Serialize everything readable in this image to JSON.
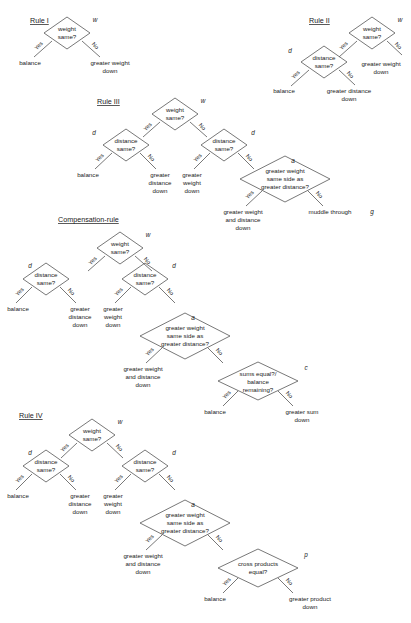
{
  "figure": {
    "type": "decision-tree-diagram",
    "background_color": "#ffffff",
    "line_color": "#555555",
    "text_color": "#1a1a1a"
  },
  "labels": {
    "weight_same": "weight",
    "weight_same2": "same?",
    "distance_same": "distance",
    "distance_same2": "same?",
    "yes": "Yes",
    "no": "No",
    "balance": "balance",
    "greater_weight": "greater weight",
    "down": "down",
    "greater": "greater",
    "distance": "distance",
    "weight": "weight",
    "muddle_through": "muddle through",
    "and_distance": "and distance",
    "same_side_as": "same side as",
    "greater_distance_q": "greater distance?",
    "greater_distance": "greater distance",
    "sums_equal": "sums equal?/",
    "balance_word": "balance",
    "remaining": "remaining?",
    "greater_sum": "greater sum",
    "cross_products": "cross products",
    "equal_q": "equal?",
    "greater_product": "greater product"
  },
  "cues": {
    "w": "w",
    "d": "d",
    "a": "a",
    "g": "g",
    "c": "c",
    "p": "p"
  },
  "sections": [
    {
      "id": "rule-1",
      "title": "Rule I",
      "nodes": [
        {
          "id": "r1-w",
          "cue": "w",
          "lines": [
            "weight",
            "same?"
          ]
        }
      ],
      "leaves": [
        {
          "id": "r1-balance",
          "lines": [
            "balance"
          ]
        },
        {
          "id": "r1-greater-weight",
          "lines": [
            "greater weight",
            "down"
          ]
        }
      ]
    },
    {
      "id": "rule-2",
      "title": "Rule II",
      "nodes": [
        {
          "id": "r2-w",
          "cue": "w",
          "lines": [
            "weight",
            "same?"
          ]
        },
        {
          "id": "r2-d",
          "cue": "d",
          "lines": [
            "distance",
            "same?"
          ]
        }
      ],
      "leaves": [
        {
          "id": "r2-greater-weight",
          "lines": [
            "greater weight",
            "down"
          ]
        },
        {
          "id": "r2-balance",
          "lines": [
            "balance"
          ]
        },
        {
          "id": "r2-greater-distance",
          "lines": [
            "greater distance",
            "down"
          ]
        }
      ]
    },
    {
      "id": "rule-3",
      "title": "Rule III",
      "nodes": [
        {
          "id": "r3-w",
          "cue": "w",
          "lines": [
            "weight",
            "same?"
          ]
        },
        {
          "id": "r3-d1",
          "cue": "d",
          "lines": [
            "distance",
            "same?"
          ]
        },
        {
          "id": "r3-d2",
          "cue": "d",
          "lines": [
            "distance",
            "same?"
          ]
        },
        {
          "id": "r3-a",
          "cue": "a",
          "lines": [
            "greater weight",
            "same side as",
            "greater distance?"
          ]
        }
      ],
      "leaves": [
        {
          "id": "r3-balance",
          "lines": [
            "balance"
          ]
        },
        {
          "id": "r3-greater-distance",
          "lines": [
            "greater",
            "distance",
            "down"
          ]
        },
        {
          "id": "r3-greater-weight",
          "lines": [
            "greater",
            "weight",
            "down"
          ]
        },
        {
          "id": "r3-greater-wd",
          "lines": [
            "greater weight",
            "and distance",
            "down"
          ]
        },
        {
          "id": "r3-muddle",
          "lines": [
            "muddle through"
          ],
          "cue": "g"
        }
      ]
    },
    {
      "id": "compensation-rule",
      "title": "Compensation-rule",
      "nodes": [
        {
          "id": "cr-w",
          "cue": "w",
          "lines": [
            "weight",
            "same?"
          ]
        },
        {
          "id": "cr-d1",
          "cue": "d",
          "lines": [
            "distance",
            "same?"
          ]
        },
        {
          "id": "cr-d2",
          "cue": "d",
          "lines": [
            "distance",
            "same?"
          ]
        },
        {
          "id": "cr-a",
          "cue": "a",
          "lines": [
            "greater weight",
            "same side as",
            "greater distance?"
          ]
        },
        {
          "id": "cr-c",
          "cue": "c",
          "lines": [
            "sums equal?/",
            "balance",
            "remaining?"
          ]
        }
      ],
      "leaves": [
        {
          "id": "cr-balance",
          "lines": [
            "balance"
          ]
        },
        {
          "id": "cr-greater-distance",
          "lines": [
            "greater",
            "distance",
            "down"
          ]
        },
        {
          "id": "cr-greater-weight",
          "lines": [
            "greater",
            "weight",
            "down"
          ]
        },
        {
          "id": "cr-greater-wd",
          "lines": [
            "greater weight",
            "and distance",
            "down"
          ]
        },
        {
          "id": "cr-balance2",
          "lines": [
            "balance"
          ]
        },
        {
          "id": "cr-greater-sum",
          "lines": [
            "greater sum",
            "down"
          ]
        }
      ]
    },
    {
      "id": "rule-4",
      "title": "Rule IV",
      "nodes": [
        {
          "id": "r4-w",
          "cue": "w",
          "lines": [
            "weight",
            "same?"
          ]
        },
        {
          "id": "r4-d1",
          "cue": "d",
          "lines": [
            "distance",
            "same?"
          ]
        },
        {
          "id": "r4-d2",
          "cue": "d",
          "lines": [
            "distance",
            "same?"
          ]
        },
        {
          "id": "r4-a",
          "cue": "a",
          "lines": [
            "greater weight",
            "same side as",
            "greater distance?"
          ]
        },
        {
          "id": "r4-p",
          "cue": "p",
          "lines": [
            "cross products",
            "equal?"
          ]
        }
      ],
      "leaves": [
        {
          "id": "r4-balance",
          "lines": [
            "balance"
          ]
        },
        {
          "id": "r4-greater-distance",
          "lines": [
            "greater",
            "distance",
            "down"
          ]
        },
        {
          "id": "r4-greater-weight",
          "lines": [
            "greater",
            "weight",
            "down"
          ]
        },
        {
          "id": "r4-greater-wd",
          "lines": [
            "greater weight",
            "and distance",
            "down"
          ]
        },
        {
          "id": "r4-balance2",
          "lines": [
            "balance"
          ]
        },
        {
          "id": "r4-greater-product",
          "lines": [
            "greater product",
            "down"
          ]
        }
      ]
    }
  ]
}
